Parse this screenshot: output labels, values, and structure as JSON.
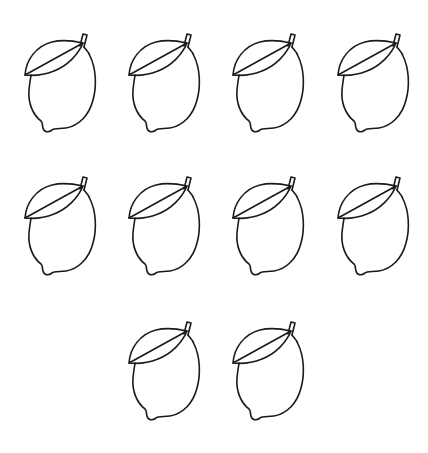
{
  "worksheet": {
    "object": "lemon",
    "count": 10,
    "stroke_color": "#1a1a1a",
    "background": "#ffffff",
    "rows": [
      {
        "count": 4,
        "y": 30,
        "x": [
          22,
          126,
          230,
          335
        ]
      },
      {
        "count": 4,
        "y": 173,
        "x": [
          22,
          126,
          230,
          335
        ]
      },
      {
        "count": 2,
        "y": 318,
        "x": [
          126,
          230
        ]
      }
    ]
  }
}
